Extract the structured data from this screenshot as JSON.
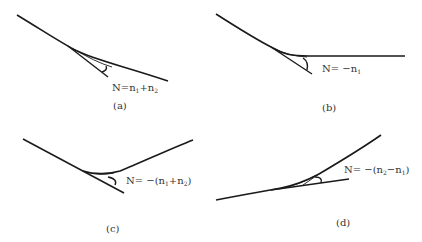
{
  "figure": {
    "panels": [
      {
        "id": "a",
        "caption": "(a)",
        "formula": "N=n1+n2",
        "formula_parts": {
          "pre": "N=n",
          "s1": "1",
          "mid": "+n",
          "s2": "2",
          "post": ""
        }
      },
      {
        "id": "b",
        "caption": "(b)",
        "formula": "N= −n1",
        "formula_parts": {
          "pre": "N= −n",
          "s1": "1",
          "mid": "",
          "s2": "",
          "post": ""
        }
      },
      {
        "id": "c",
        "caption": "(c)",
        "formula": "N= −(n1+n2)",
        "formula_parts": {
          "pre": "N= −(n",
          "s1": "1",
          "mid": "+n",
          "s2": "2",
          "post": ")"
        }
      },
      {
        "id": "d",
        "caption": "(d)",
        "formula": "N= −(n2−n1)",
        "formula_parts": {
          "pre": "N= −(n",
          "s1": "2",
          "mid": "−n",
          "s2": "1",
          "post": ")"
        }
      }
    ]
  },
  "colors": {
    "line": "#1a1a1a",
    "text": "#333333",
    "background": "#ffffff"
  }
}
